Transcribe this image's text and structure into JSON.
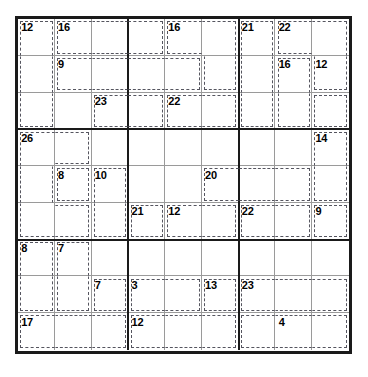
{
  "puzzle": {
    "type": "killer-sudoku",
    "grid_size": 9,
    "box_rows": 3,
    "box_cols": 3,
    "colors": {
      "grid_border": "#1a1a1a",
      "box_line": "#1a1a1a",
      "cell_line": "#9a9a9a",
      "cage_line": "#55555f",
      "background": "#ffffff",
      "sum_text": "#000000"
    },
    "cages": [
      {
        "sum": "12",
        "anchor": [
          0,
          0
        ],
        "cells": [
          [
            0,
            0
          ],
          [
            1,
            0
          ],
          [
            2,
            0
          ]
        ]
      },
      {
        "sum": "16",
        "anchor": [
          0,
          1
        ],
        "cells": [
          [
            0,
            1
          ],
          [
            0,
            2
          ],
          [
            0,
            3
          ]
        ]
      },
      {
        "sum": "16",
        "anchor": [
          0,
          4
        ],
        "cells": [
          [
            0,
            4
          ],
          [
            0,
            5
          ],
          [
            1,
            5
          ]
        ]
      },
      {
        "sum": "21",
        "anchor": [
          0,
          6
        ],
        "cells": [
          [
            0,
            6
          ],
          [
            1,
            6
          ],
          [
            2,
            6
          ]
        ]
      },
      {
        "sum": "22",
        "anchor": [
          0,
          7
        ],
        "cells": [
          [
            0,
            7
          ],
          [
            0,
            8
          ],
          [
            1,
            8
          ]
        ]
      },
      {
        "sum": "9",
        "anchor": [
          1,
          1
        ],
        "cells": [
          [
            1,
            1
          ],
          [
            1,
            2
          ],
          [
            1,
            3
          ],
          [
            1,
            4
          ]
        ]
      },
      {
        "sum": "16",
        "anchor": [
          1,
          7
        ],
        "cells": [
          [
            1,
            7
          ],
          [
            2,
            7
          ]
        ]
      },
      {
        "sum": "12",
        "anchor": [
          1,
          8
        ],
        "cells": [
          [
            2,
            8
          ]
        ]
      },
      {
        "sum": "23",
        "anchor": [
          2,
          2
        ],
        "cells": [
          [
            2,
            2
          ],
          [
            2,
            3
          ]
        ]
      },
      {
        "sum": "22",
        "anchor": [
          2,
          4
        ],
        "cells": [
          [
            2,
            4
          ],
          [
            2,
            5
          ]
        ]
      },
      {
        "sum": "26",
        "anchor": [
          3,
          0
        ],
        "cells": [
          [
            3,
            0
          ],
          [
            3,
            1
          ],
          [
            4,
            0
          ],
          [
            5,
            0
          ],
          [
            5,
            1
          ]
        ]
      },
      {
        "sum": "14",
        "anchor": [
          3,
          8
        ],
        "cells": [
          [
            3,
            8
          ],
          [
            4,
            8
          ]
        ]
      },
      {
        "sum": "8",
        "anchor": [
          4,
          1
        ],
        "cells": [
          [
            4,
            1
          ]
        ]
      },
      {
        "sum": "10",
        "anchor": [
          4,
          2
        ],
        "cells": [
          [
            4,
            2
          ],
          [
            5,
            2
          ]
        ]
      },
      {
        "sum": "20",
        "anchor": [
          4,
          5
        ],
        "cells": [
          [
            4,
            5
          ],
          [
            4,
            6
          ],
          [
            4,
            7
          ]
        ]
      },
      {
        "sum": "21",
        "anchor": [
          5,
          3
        ],
        "cells": [
          [
            5,
            3
          ]
        ]
      },
      {
        "sum": "12",
        "anchor": [
          5,
          4
        ],
        "cells": [
          [
            5,
            4
          ],
          [
            5,
            5
          ]
        ]
      },
      {
        "sum": "22",
        "anchor": [
          5,
          6
        ],
        "cells": [
          [
            5,
            6
          ],
          [
            5,
            7
          ]
        ]
      },
      {
        "sum": "9",
        "anchor": [
          5,
          8
        ],
        "cells": [
          [
            5,
            8
          ]
        ]
      },
      {
        "sum": "8",
        "anchor": [
          6,
          0
        ],
        "cells": [
          [
            6,
            0
          ],
          [
            7,
            0
          ]
        ]
      },
      {
        "sum": "7",
        "anchor": [
          6,
          1
        ],
        "cells": [
          [
            6,
            1
          ],
          [
            7,
            1
          ]
        ]
      },
      {
        "sum": "7",
        "anchor": [
          7,
          2
        ],
        "cells": [
          [
            7,
            2
          ]
        ]
      },
      {
        "sum": "3",
        "anchor": [
          7,
          3
        ],
        "cells": [
          [
            7,
            3
          ],
          [
            7,
            4
          ]
        ]
      },
      {
        "sum": "13",
        "anchor": [
          7,
          5
        ],
        "cells": [
          [
            7,
            5
          ]
        ]
      },
      {
        "sum": "23",
        "anchor": [
          7,
          6
        ],
        "cells": [
          [
            7,
            6
          ],
          [
            7,
            7
          ],
          [
            7,
            8
          ]
        ]
      },
      {
        "sum": "17",
        "anchor": [
          8,
          0
        ],
        "cells": [
          [
            8,
            0
          ],
          [
            8,
            1
          ],
          [
            8,
            2
          ]
        ]
      },
      {
        "sum": "12",
        "anchor": [
          8,
          3
        ],
        "cells": [
          [
            8,
            3
          ],
          [
            8,
            4
          ],
          [
            8,
            5
          ]
        ]
      },
      {
        "sum": "4",
        "anchor": [
          8,
          7
        ],
        "cells": [
          [
            8,
            6
          ],
          [
            8,
            7
          ],
          [
            8,
            8
          ]
        ]
      }
    ]
  }
}
